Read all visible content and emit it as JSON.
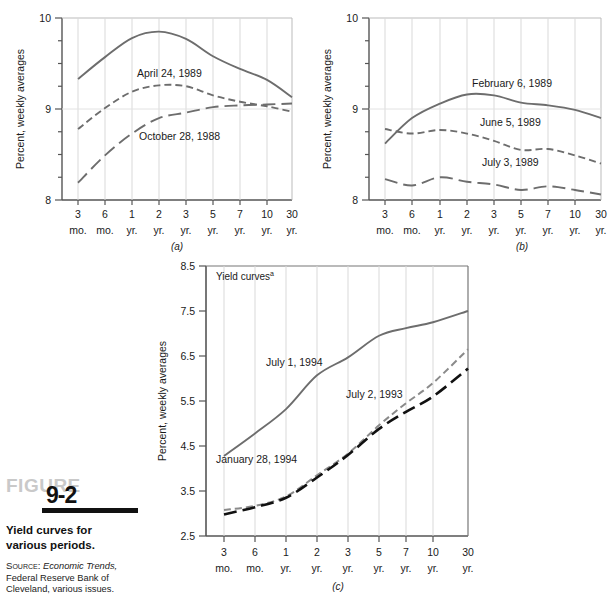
{
  "figure": {
    "word": "FIGURE",
    "number": "9-2",
    "caption": "Yield curves for various periods.",
    "source_label": "Source:",
    "source_italic": "Economic Trends,",
    "source_rest": "Federal Reserve Bank of Cleveland, various issues."
  },
  "common": {
    "ylabel": "Percent, weekly averages",
    "x_top": [
      "3",
      "6",
      "1",
      "2",
      "3",
      "5",
      "7",
      "10",
      "30"
    ],
    "x_bot": [
      "mo.",
      "mo.",
      "yr.",
      "yr.",
      "yr.",
      "yr.",
      "yr.",
      "yr.",
      "yr."
    ],
    "line_color_solid": "#6d6d6d",
    "line_color_dash": "#6d6d6d",
    "line_color_longdash": "#6d6d6d",
    "line_color_black": "#111111",
    "grid_color": "#d9d9d9",
    "axis_color": "#555555"
  },
  "chart_data": [
    {
      "id": "a",
      "type": "line",
      "panel_label": "(a)",
      "title": "",
      "xlabel": "",
      "ylabel": "Percent, weekly averages",
      "categories": [
        "3 mo.",
        "6 mo.",
        "1 yr.",
        "2 yr.",
        "3 yr.",
        "5 yr.",
        "7 yr.",
        "10 yr.",
        "30 yr."
      ],
      "ylim": [
        8,
        10
      ],
      "yticks": [
        8,
        9,
        10
      ],
      "ytick_labels": [
        "8",
        "9",
        "10"
      ],
      "grid": true,
      "series": [
        {
          "name": "April 24, 1989",
          "style": "solid",
          "values": [
            9.33,
            9.57,
            9.78,
            9.85,
            9.77,
            9.58,
            9.44,
            9.32,
            9.13
          ]
        },
        {
          "name": "October 28, 1988",
          "style": "dashed",
          "values": [
            8.78,
            9.01,
            9.19,
            9.26,
            9.25,
            9.15,
            9.08,
            9.03,
            8.97
          ]
        },
        {
          "name": "",
          "style": "long-dashed",
          "values": [
            8.19,
            8.49,
            8.73,
            8.9,
            8.96,
            9.02,
            9.04,
            9.05,
            9.06
          ]
        }
      ],
      "annotations": [
        {
          "text": "April 24, 1989",
          "x": 0.43,
          "y": 9.52
        },
        {
          "text": "October 28, 1988",
          "x": 0.45,
          "y": 8.81
        }
      ]
    },
    {
      "id": "b",
      "type": "line",
      "panel_label": "(b)",
      "title": "",
      "xlabel": "",
      "ylabel": "Percent, weekly averages",
      "categories": [
        "3 mo.",
        "6 mo.",
        "1 yr.",
        "2 yr.",
        "3 yr.",
        "5 yr.",
        "7 yr.",
        "10 yr.",
        "30 yr."
      ],
      "ylim": [
        8,
        10
      ],
      "yticks": [
        8,
        9,
        10
      ],
      "ytick_labels": [
        "8",
        "9",
        "10"
      ],
      "grid": true,
      "series": [
        {
          "name": "February 6, 1989",
          "style": "solid",
          "values": [
            8.62,
            8.9,
            9.06,
            9.16,
            9.15,
            9.07,
            9.04,
            8.99,
            8.9
          ]
        },
        {
          "name": "June 5, 1989",
          "style": "dashed",
          "values": [
            8.78,
            8.73,
            8.77,
            8.73,
            8.65,
            8.55,
            8.56,
            8.49,
            8.4
          ]
        },
        {
          "name": "July 3, 1989",
          "style": "long-dashed",
          "values": [
            8.23,
            8.16,
            8.25,
            8.2,
            8.17,
            8.11,
            8.15,
            8.11,
            8.06
          ]
        }
      ],
      "annotations": [
        {
          "text": "February 6, 1989",
          "x": 0.5,
          "y": 9.3
        },
        {
          "text": "June 5, 1989",
          "x": 0.53,
          "y": 8.85
        },
        {
          "text": "July 3, 1989",
          "x": 0.56,
          "y": 8.33
        }
      ]
    },
    {
      "id": "c",
      "type": "line",
      "panel_label": "(c)",
      "title": "Yield curves",
      "title_superscript": "a",
      "xlabel": "",
      "ylabel": "Percent, weekly averages",
      "categories": [
        "3 mo.",
        "6 mo.",
        "1 yr.",
        "2 yr.",
        "3 yr.",
        "5 yr.",
        "7 yr.",
        "10 yr.",
        "30 yr."
      ],
      "ylim": [
        2.5,
        8.5
      ],
      "yticks": [
        2.5,
        3.5,
        4.5,
        5.5,
        6.5,
        7.5,
        8.5
      ],
      "ytick_labels": [
        "2.5",
        "3.5",
        "4.5",
        "5.5",
        "6.5",
        "7.5",
        "8.5"
      ],
      "grid": true,
      "series": [
        {
          "name": "July 1, 1994",
          "style": "solid",
          "values": [
            4.28,
            4.78,
            5.32,
            6.07,
            6.47,
            6.95,
            7.12,
            7.25,
            7.5
          ]
        },
        {
          "name": "July 2, 1993",
          "style": "dashed-gray",
          "values": [
            3.08,
            3.17,
            3.38,
            3.85,
            4.33,
            4.96,
            5.45,
            5.9,
            6.65
          ]
        },
        {
          "name": "January 28, 1994",
          "style": "long-dashed-black",
          "values": [
            2.98,
            3.14,
            3.35,
            3.8,
            4.3,
            4.88,
            5.26,
            5.6,
            6.22
          ]
        }
      ],
      "annotations": [
        {
          "text": "July 1, 1994",
          "x": 0.3,
          "y": 6.1
        },
        {
          "text": "July 2, 1993",
          "x": 0.58,
          "y": 5.45
        },
        {
          "text": "January 28, 1994",
          "x": 0.16,
          "y": 4.15
        }
      ]
    }
  ]
}
